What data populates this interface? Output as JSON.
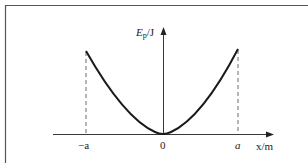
{
  "diagram": {
    "y_axis_label_main": "E",
    "y_axis_label_sub": "p",
    "y_axis_unit": "/J",
    "x_axis_label": "x/m",
    "origin_label": "0",
    "left_mark_label": "−a",
    "right_mark_label": "a",
    "curve": "parabola",
    "colors": {
      "line": "#1a1a1a",
      "frame": "#555555",
      "background": "#ffffff"
    }
  }
}
